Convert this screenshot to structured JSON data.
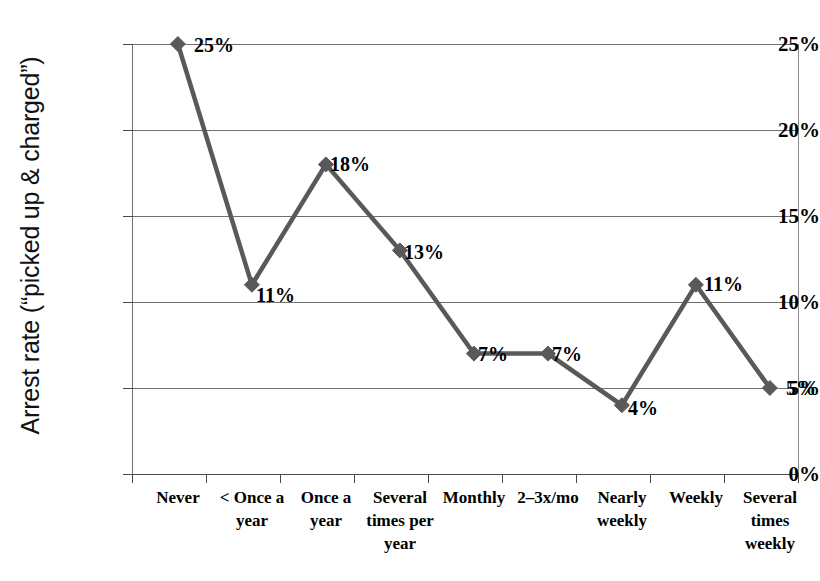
{
  "chart_data": {
    "type": "line",
    "title": "",
    "xlabel": "",
    "ylabel": "Arrest rate (“picked up & charged”)",
    "categories": [
      "Never",
      "< Once a year",
      "Once a year",
      "Several times per year",
      "Monthly",
      "2–3x/mo",
      "Nearly weekly",
      "Weekly",
      "Several times weekly"
    ],
    "values": [
      25,
      11,
      18,
      13,
      7,
      7,
      4,
      11,
      5
    ],
    "point_labels": [
      "25%",
      "11%",
      "18%",
      "13%",
      "7%",
      "7%",
      "4%",
      "11%",
      "5%"
    ],
    "ylim": [
      0,
      25
    ],
    "ytick_values": [
      0,
      5,
      10,
      15,
      20,
      25
    ],
    "ytick_labels": [
      "0%",
      "5%",
      "10%",
      "15%",
      "20%",
      "25%"
    ],
    "grid": "horizontal",
    "legend": "none",
    "series_color": "#595959",
    "marker": "diamond",
    "gridline_color": "#6f6f6f"
  },
  "axis": {
    "y_title": "Arrest rate (“picked up & charged”)"
  }
}
